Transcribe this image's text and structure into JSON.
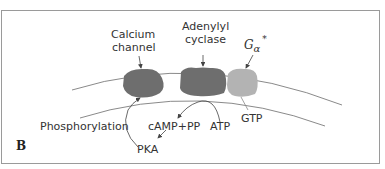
{
  "figure": {
    "panel_label": "B",
    "components": {
      "calcium_channel": {
        "line1": "Calcium",
        "line2": "channel",
        "color": "#6e6e6e"
      },
      "adenylyl_cyclase": {
        "line1": "Adenylyl",
        "line2": "cyclase",
        "color": "#6e6e6e"
      },
      "g_alpha": {
        "base": "G",
        "subscript": "α",
        "superscript": "*",
        "color": "#b3b3b3"
      }
    },
    "labels": {
      "phosphorylation": "Phosphorylation",
      "camp_pp": "cAMP+PP",
      "atp": "ATP",
      "gtp": "GTP",
      "pka": "PKA"
    },
    "colors": {
      "membrane_line": "#8a8a8a",
      "border": "#9a9a9a",
      "arrow": "#444444"
    }
  }
}
